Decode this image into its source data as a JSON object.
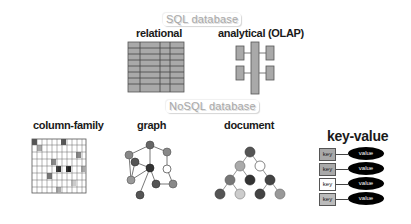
{
  "sections": {
    "sql": {
      "label": "SQL database"
    },
    "nosql": {
      "label": "NoSQL database"
    }
  },
  "models": {
    "relational": {
      "title": "relational",
      "icon": "table-grid-icon"
    },
    "analytical": {
      "title": "analytical  (OLAP)",
      "icon": "olap-cube-icon"
    },
    "column_family": {
      "title": "column-family",
      "icon": "column-grid-icon"
    },
    "graph": {
      "title": "graph",
      "icon": "graph-network-icon"
    },
    "document": {
      "title": "document",
      "icon": "document-tree-icon"
    },
    "key_value": {
      "title": "key-value",
      "icon": "key-value-pairs-icon",
      "pairs": [
        {
          "key": "key",
          "value": "value"
        },
        {
          "key": "key",
          "value": "value"
        },
        {
          "key": "key",
          "value": "value"
        },
        {
          "key": "key",
          "value": "value"
        }
      ]
    }
  },
  "colors": {
    "cell_gray": "#a9a9a9",
    "node_dark": "#444444",
    "node_mid": "#7a7a7a",
    "node_light": "#b3b3b3",
    "value_ellipse": "#000000"
  }
}
